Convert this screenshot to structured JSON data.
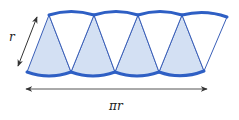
{
  "diagram": {
    "labels": {
      "radius": "r",
      "base": "πr"
    },
    "sectors": {
      "up_pointing_count": 4,
      "down_pointing_count": 4
    },
    "colors": {
      "arc_stroke": "#2e5fc4",
      "edge_stroke": "#3a5fb8",
      "shaded_fill": "#d3e0f3",
      "unshaded_fill": "#ffffff",
      "arrow": "#333333",
      "text": "#222222"
    }
  }
}
